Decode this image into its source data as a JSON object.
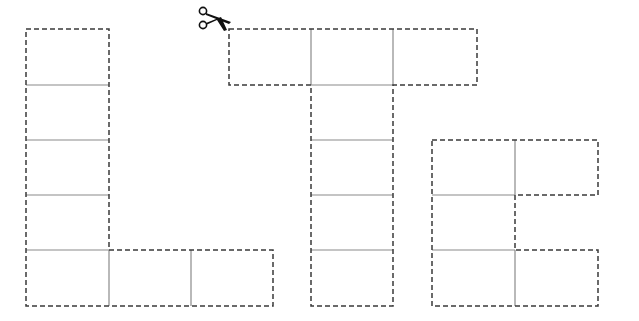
{
  "colors": {
    "background": "#ffffff",
    "dashed_outline": "#3a3a3a",
    "cell_divider": "#8a8a8a",
    "scissors": "#111111"
  },
  "icons": {
    "scissors": "scissors-icon"
  },
  "letters": [
    {
      "name": "L",
      "outline": [
        [
          26,
          29
        ],
        [
          109,
          29
        ],
        [
          109,
          250
        ],
        [
          273,
          250
        ],
        [
          273,
          306
        ],
        [
          26,
          306
        ]
      ],
      "dividers": [
        [
          [
            26,
            85
          ],
          [
            109,
            85
          ]
        ],
        [
          [
            26,
            140
          ],
          [
            109,
            140
          ]
        ],
        [
          [
            26,
            195
          ],
          [
            109,
            195
          ]
        ],
        [
          [
            26,
            250
          ],
          [
            109,
            250
          ]
        ],
        [
          [
            109,
            250
          ],
          [
            109,
            306
          ]
        ],
        [
          [
            191,
            250
          ],
          [
            191,
            306
          ]
        ]
      ]
    },
    {
      "name": "T",
      "outline": [
        [
          229,
          29
        ],
        [
          477,
          29
        ],
        [
          477,
          85
        ],
        [
          393,
          85
        ],
        [
          393,
          306
        ],
        [
          311,
          306
        ],
        [
          311,
          85
        ],
        [
          229,
          85
        ]
      ],
      "dividers": [
        [
          [
            311,
            29
          ],
          [
            311,
            85
          ]
        ],
        [
          [
            393,
            29
          ],
          [
            393,
            85
          ]
        ],
        [
          [
            311,
            85
          ],
          [
            393,
            85
          ]
        ],
        [
          [
            311,
            140
          ],
          [
            393,
            140
          ]
        ],
        [
          [
            311,
            195
          ],
          [
            393,
            195
          ]
        ],
        [
          [
            311,
            250
          ],
          [
            393,
            250
          ]
        ]
      ]
    },
    {
      "name": "E",
      "outline": [
        [
          432,
          140
        ],
        [
          598,
          140
        ],
        [
          598,
          195
        ],
        [
          515,
          195
        ],
        [
          515,
          250
        ],
        [
          598,
          250
        ],
        [
          598,
          306
        ],
        [
          432,
          306
        ]
      ],
      "dividers": [
        [
          [
            515,
            140
          ],
          [
            515,
            195
          ]
        ],
        [
          [
            432,
            195
          ],
          [
            515,
            195
          ]
        ],
        [
          [
            432,
            250
          ],
          [
            515,
            250
          ]
        ],
        [
          [
            515,
            250
          ],
          [
            515,
            306
          ]
        ]
      ]
    }
  ]
}
